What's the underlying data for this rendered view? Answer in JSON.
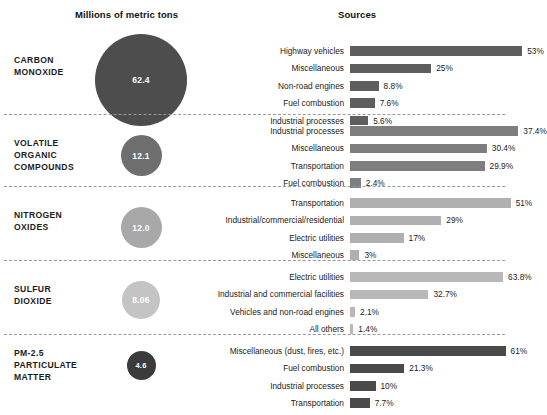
{
  "header": {
    "left_title": "Millions of metric tons",
    "right_title": "Sources"
  },
  "colors": {
    "dark": "#4d4d4d",
    "medium_dark": "#6e6e6e",
    "medium": "#9a9a9a",
    "light": "#b5b5b5",
    "darkest": "#3b3b3b",
    "divider": "#9a9a9a",
    "text": "#1b1b1b",
    "background": "#ffffff"
  },
  "chart_data": {
    "type": "bar",
    "xlabel": "",
    "ylabel": "",
    "units": "Millions of metric tons",
    "value_unit": "percent",
    "grid": false,
    "legend": "none",
    "sections": [
      {
        "pollutant": "CARBON\nMONOXIDE",
        "pollutant_lines": [
          "CARBON",
          "MONOXIDE"
        ],
        "total": "62.4",
        "total_value": 62.4,
        "bubble_diameter_px": 92,
        "bubble_color": "#4d4d4d",
        "bar_color": "#5e5e5e",
        "px_per_percent": 3.25,
        "categories": [
          "Highway vehicles",
          "Miscellaneous",
          "Non-road engines",
          "Fuel combustion",
          "Industrial processes"
        ],
        "values": [
          53,
          25,
          8.8,
          7.6,
          5.6
        ],
        "value_labels": [
          "53%",
          "25%",
          "8.8%",
          "7.6%",
          "5.6%"
        ]
      },
      {
        "pollutant": "VOLATILE\nORGANIC\nCOMPOUNDS",
        "pollutant_lines": [
          "VOLATILE",
          "ORGANIC",
          "COMPOUNDS"
        ],
        "total": "12.1",
        "total_value": 12.1,
        "bubble_diameter_px": 41,
        "bubble_color": "#6e6e6e",
        "bar_color": "#7e7e7e",
        "px_per_percent": 4.5,
        "categories": [
          "Industrial processes",
          "Miscellaneous",
          "Transportation",
          "Fuel combustion"
        ],
        "values": [
          37.4,
          30.4,
          29.9,
          2.4
        ],
        "value_labels": [
          "37.4%",
          "30.4%",
          "29.9%",
          "2.4%"
        ]
      },
      {
        "pollutant": "NITROGEN\nOXIDES",
        "pollutant_lines": [
          "NITROGEN",
          "OXIDES"
        ],
        "total": "12.0",
        "total_value": 12.0,
        "bubble_diameter_px": 41,
        "bubble_color": "#a8a8a8",
        "bar_color": "#b0b0b0",
        "px_per_percent": 3.15,
        "categories": [
          "Transportation",
          "Industrial/commercial/residential",
          "Electric utilities",
          "Miscellaneous"
        ],
        "values": [
          51,
          29,
          17,
          3
        ],
        "value_labels": [
          "51%",
          "29%",
          "17%",
          "3%"
        ]
      },
      {
        "pollutant": "SULFUR\nDIOXIDE",
        "pollutant_lines": [
          "SULFUR",
          "DIOXIDE"
        ],
        "total": "8.06",
        "total_value": 8.06,
        "bubble_diameter_px": 38,
        "bubble_color": "#c4c4c4",
        "bar_color": "#b8b8b8",
        "px_per_percent": 2.4,
        "categories": [
          "Electric utilities",
          "Industrial and commercial facilities",
          "Vehicles and non-road engines",
          "All others"
        ],
        "values": [
          63.8,
          32.7,
          2.1,
          1.4
        ],
        "value_labels": [
          "63.8%",
          "32.7%",
          "2.1%",
          "1.4%"
        ]
      },
      {
        "pollutant": "PM-2.5\nPARTICULATE\nMATTER",
        "pollutant_lines": [
          "PM-2.5",
          "PARTICULATE",
          "MATTER"
        ],
        "total": "4.6",
        "total_value": 4.6,
        "bubble_diameter_px": 29,
        "bubble_color": "#3b3b3b",
        "bar_color": "#4a4a4a",
        "px_per_percent": 2.55,
        "categories": [
          "Miscellaneous (dust, fires, etc.)",
          "Fuel combustion",
          "Industrial processes",
          "Transportation"
        ],
        "values": [
          61,
          21.3,
          10,
          7.7
        ],
        "value_labels": [
          "61%",
          "21.3%",
          "10%",
          "7.7%"
        ]
      }
    ]
  }
}
